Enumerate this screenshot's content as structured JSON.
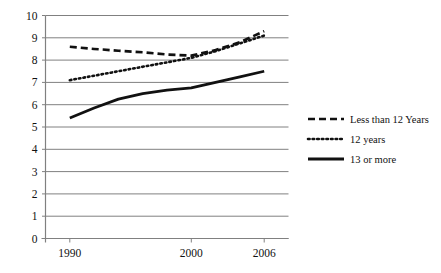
{
  "chart_data": {
    "type": "line",
    "title": "",
    "xlabel": "",
    "ylabel": "",
    "x": [
      1990,
      2000,
      2006
    ],
    "xtick_labels": [
      "1990",
      "2000",
      "2006"
    ],
    "ytick_labels": [
      "0",
      "1",
      "2",
      "3",
      "4",
      "5",
      "6",
      "7",
      "8",
      "9",
      "10"
    ],
    "ylim": [
      0,
      10
    ],
    "xlim": [
      1988,
      2008
    ],
    "grid": "horizontal",
    "legend_position": "right",
    "series": [
      {
        "name": "Less than 12 Years",
        "style": "dashed",
        "color": "#111111",
        "points": [
          {
            "x": 1990,
            "y": 8.6
          },
          {
            "x": 1992,
            "y": 8.5
          },
          {
            "x": 1994,
            "y": 8.42
          },
          {
            "x": 1996,
            "y": 8.35
          },
          {
            "x": 1998,
            "y": 8.25
          },
          {
            "x": 2000,
            "y": 8.2
          },
          {
            "x": 2002,
            "y": 8.45
          },
          {
            "x": 2004,
            "y": 8.8
          },
          {
            "x": 2006,
            "y": 9.3
          }
        ]
      },
      {
        "name": "12 years",
        "style": "dotted",
        "color": "#111111",
        "points": [
          {
            "x": 1990,
            "y": 7.1
          },
          {
            "x": 1992,
            "y": 7.3
          },
          {
            "x": 1994,
            "y": 7.5
          },
          {
            "x": 1996,
            "y": 7.7
          },
          {
            "x": 1998,
            "y": 7.9
          },
          {
            "x": 2000,
            "y": 8.1
          },
          {
            "x": 2002,
            "y": 8.4
          },
          {
            "x": 2004,
            "y": 8.75
          },
          {
            "x": 2006,
            "y": 9.1
          }
        ]
      },
      {
        "name": "13 or more",
        "style": "solid",
        "color": "#111111",
        "points": [
          {
            "x": 1990,
            "y": 5.4
          },
          {
            "x": 1992,
            "y": 5.85
          },
          {
            "x": 1994,
            "y": 6.25
          },
          {
            "x": 1996,
            "y": 6.5
          },
          {
            "x": 1998,
            "y": 6.65
          },
          {
            "x": 2000,
            "y": 6.75
          },
          {
            "x": 2002,
            "y": 7.0
          },
          {
            "x": 2004,
            "y": 7.25
          },
          {
            "x": 2006,
            "y": 7.5
          }
        ]
      }
    ]
  },
  "legend": {
    "entries": [
      {
        "label": "Less than 12 Years",
        "style": "dashed"
      },
      {
        "label": "12 years",
        "style": "dotted"
      },
      {
        "label": "13 or more",
        "style": "solid"
      }
    ]
  },
  "colors": {
    "gridline": "#808080",
    "axis": "#808080",
    "series": "#111111",
    "background": "#ffffff"
  }
}
